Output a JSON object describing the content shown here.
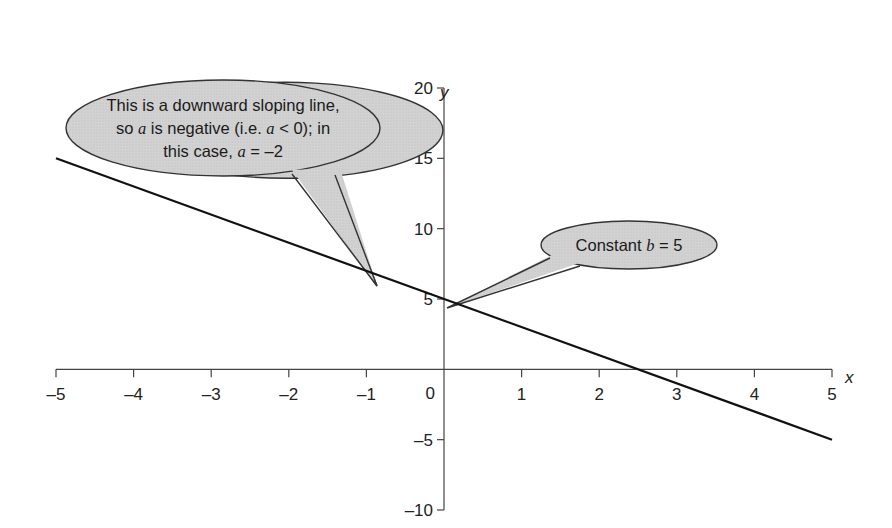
{
  "chart_data": {
    "type": "line",
    "title": "",
    "xlabel": "x",
    "ylabel": "y",
    "xlim": [
      -5,
      5
    ],
    "ylim": [
      -10,
      20
    ],
    "x_ticks": [
      -5,
      -4,
      -3,
      -2,
      -1,
      0,
      1,
      2,
      3,
      4,
      5
    ],
    "x_tick_labels": [
      "–5",
      "–4",
      "–3",
      "–2",
      "–1",
      "0",
      "1",
      "2",
      "3",
      "4",
      "5"
    ],
    "y_ticks": [
      -10,
      -5,
      5,
      10,
      15,
      20
    ],
    "y_tick_labels": [
      "–10",
      "–5",
      "5",
      "10",
      "15",
      "20"
    ],
    "grid": false,
    "series": [
      {
        "name": "y = -2x + 5",
        "x": [
          -5,
          5
        ],
        "y": [
          15,
          -5
        ],
        "color": "#111111"
      }
    ],
    "annotations": [
      {
        "id": "slope-callout",
        "lines": [
          [
            "This is a downward sloping line,"
          ],
          [
            "so ",
            {
              "i": "a"
            },
            " is negative (i.e. ",
            {
              "i": "a"
            },
            " < 0); in"
          ],
          [
            "this case, ",
            {
              "i": "a"
            },
            " = –2"
          ]
        ],
        "points_to": [
          -0.9,
          6.8
        ]
      },
      {
        "id": "intercept-callout",
        "lines": [
          [
            "Constant ",
            {
              "i": "b"
            },
            " = 5"
          ]
        ],
        "points_to": [
          0,
          5
        ]
      }
    ],
    "callout_fill": "#cfcfcf",
    "callout_stroke": "#333333"
  },
  "labels": {
    "x_axis": "x",
    "y_axis": "y",
    "origin": "0",
    "slope_line1": "This is a downward sloping line,",
    "slope_line2_a": "so ",
    "slope_line2_var1": "a",
    "slope_line2_b": " is negative (i.e. ",
    "slope_line2_var2": "a",
    "slope_line2_c": " < 0); in",
    "slope_line3_a": "this case, ",
    "slope_line3_var": "a",
    "slope_line3_b": " = –2",
    "intercept_a": "Constant ",
    "intercept_var": "b",
    "intercept_b": " = 5"
  }
}
